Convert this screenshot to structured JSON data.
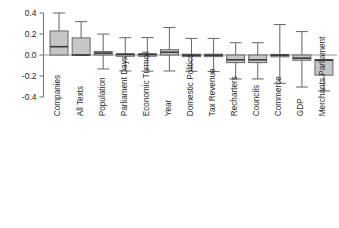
{
  "chart_data": {
    "type": "boxplot",
    "title": "",
    "xlabel": "",
    "ylabel": "",
    "ylim": [
      -0.4,
      0.4
    ],
    "yticks": [
      0.4,
      0.2,
      0.0,
      -0.2,
      -0.4
    ],
    "ytick_labels": [
      "0.4",
      "0.2",
      "0.0",
      "-0.2",
      "-0.4"
    ],
    "grid": false,
    "legend": "none",
    "zero_reference": 0.0,
    "categories": [
      "Companies",
      "All Texts",
      "Population",
      "Parliament Days",
      "Economic Turmoil",
      "Year",
      "Domestic Politics",
      "Tax Revenue",
      "Recharters",
      "Councils",
      "Commerce",
      "GDP",
      "Merchants Parliament"
    ],
    "boxes": [
      {
        "category": "Companies",
        "whisker_low": 0.075,
        "box_low": 0.0,
        "median": 0.079,
        "box_high": 0.229,
        "whisker_high": 0.4
      },
      {
        "category": "All Texts",
        "whisker_low": -0.002,
        "box_low": 0.0,
        "median": 0.0,
        "box_high": 0.163,
        "whisker_high": 0.318
      },
      {
        "category": "Population",
        "whisker_low": -0.133,
        "box_low": 0.0,
        "median": 0.018,
        "box_high": 0.034,
        "whisker_high": 0.199
      },
      {
        "category": "Parliament Days",
        "whisker_low": -0.152,
        "box_low": -0.006,
        "median": 0.005,
        "box_high": 0.012,
        "whisker_high": 0.165
      },
      {
        "category": "Economic Turmoil",
        "whisker_low": -0.154,
        "box_low": -0.006,
        "median": 0.004,
        "box_high": 0.012,
        "whisker_high": 0.166
      },
      {
        "category": "Year",
        "whisker_low": -0.152,
        "box_low": 0.0,
        "median": 0.026,
        "box_high": 0.05,
        "whisker_high": 0.262
      },
      {
        "category": "Domestic Politics",
        "whisker_low": -0.155,
        "box_low": -0.01,
        "median": -0.002,
        "box_high": 0.008,
        "whisker_high": 0.158
      },
      {
        "category": "Tax Revenue",
        "whisker_low": -0.158,
        "box_low": -0.01,
        "median": -0.002,
        "box_high": 0.008,
        "whisker_high": 0.158
      },
      {
        "category": "Recharters",
        "whisker_low": -0.228,
        "box_low": -0.073,
        "median": -0.046,
        "box_high": 0.0,
        "whisker_high": 0.117
      },
      {
        "category": "Councils",
        "whisker_low": -0.228,
        "box_low": -0.073,
        "median": -0.046,
        "box_high": 0.0,
        "whisker_high": 0.117
      },
      {
        "category": "Commerce",
        "whisker_low": -0.27,
        "box_low": -0.008,
        "median": -0.002,
        "box_high": 0.006,
        "whisker_high": 0.29
      },
      {
        "category": "GDP",
        "whisker_low": -0.305,
        "box_low": -0.05,
        "median": -0.03,
        "box_high": 0.0,
        "whisker_high": 0.223
      },
      {
        "category": "Merchants Parliament",
        "whisker_low": -0.342,
        "box_low": -0.192,
        "median": -0.05,
        "box_high": -0.043,
        "whisker_high": -0.043
      }
    ],
    "style": {
      "box_fill": "#c6c6c6",
      "box_edge": "#5a5a5a",
      "whisker_color": "#6b6b6b",
      "median_color": "#3a3a3a",
      "axis_color": "#7a7a7a",
      "text_color": "#2b2b2b",
      "background": "#ffffff"
    }
  }
}
